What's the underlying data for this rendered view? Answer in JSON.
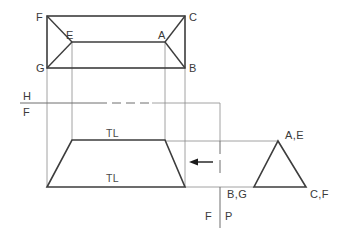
{
  "drawing": {
    "title": "Orthographic Projection - Truncated Pyramid Auxiliary View",
    "colors": {
      "object_line": "#3d3d3d",
      "projection_line": "#8c8c8c",
      "fold_line": "#6e6e6e",
      "text": "#3a3a3a",
      "background": "#ffffff",
      "arrow": "#1a1a1a"
    },
    "views": {
      "top_view": {
        "name": "top-view",
        "outer_rect": {
          "x1": 47,
          "y1": 16,
          "x2": 185,
          "y2": 68
        },
        "inner_top_edge": {
          "x1": 72,
          "y1": 42,
          "x2": 165,
          "y2": 42
        },
        "corner_labels": [
          {
            "text": "F",
            "x": 36,
            "y": 17
          },
          {
            "text": "C",
            "x": 190,
            "y": 17
          },
          {
            "text": "G",
            "x": 36,
            "y": 70
          },
          {
            "text": "B",
            "x": 190,
            "y": 70
          },
          {
            "text": "E",
            "x": 66,
            "y": 38
          },
          {
            "text": "A",
            "x": 159,
            "y": 38
          }
        ]
      },
      "front_view": {
        "name": "front-view",
        "trapezoid": {
          "top_left_x": 72,
          "top_right_x": 165,
          "top_y": 140,
          "bottom_left_x": 47,
          "bottom_right_x": 185,
          "bottom_y": 187
        },
        "tl_labels": [
          {
            "text": "TL",
            "x": 112,
            "y": 136
          },
          {
            "text": "TL",
            "x": 112,
            "y": 181
          }
        ]
      },
      "side_view": {
        "name": "side-view",
        "triangle": {
          "apex_x": 278,
          "apex_y": 141,
          "base_left_x": 254,
          "base_right_x": 306,
          "base_y": 187
        },
        "corner_labels": [
          {
            "text": "A,E",
            "x": 284,
            "y": 138
          },
          {
            "text": "C,F",
            "x": 310,
            "y": 196
          },
          {
            "text": "B,G",
            "x": 226,
            "y": 196
          }
        ]
      }
    },
    "fold_lines": {
      "hf": {
        "name": "h-f-fold-line",
        "y": 103,
        "x_start": 20,
        "x_end": 220,
        "upper_label": "H",
        "lower_label": "F",
        "label_x": 26,
        "upper_label_y": 99,
        "lower_label_y": 115
      },
      "fp": {
        "name": "f-p-fold-line",
        "x": 220,
        "y_start": 103,
        "y_end": 228,
        "left_label": "F",
        "right_label": "P",
        "left_label_x": 207,
        "right_label_x": 225,
        "label_y": 219
      }
    },
    "arrow": {
      "name": "view-direction-arrow",
      "x_tail": 213,
      "x_head": 190,
      "y": 162
    },
    "labels_all": [
      "F",
      "C",
      "E",
      "A",
      "G",
      "B",
      "H",
      "F",
      "TL",
      "TL",
      "A,E",
      "C,F",
      "B,G",
      "F",
      "P"
    ]
  }
}
